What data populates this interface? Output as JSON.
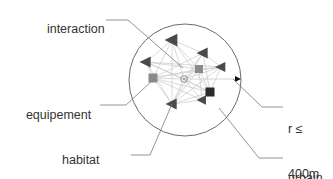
{
  "diagram": {
    "title": "urbain system",
    "labels": {
      "interaction": "interaction",
      "equipement": "equipement",
      "habitat_line1": "habitat",
      "habitat_line2": "groupe",
      "radius_line1": "r ≤",
      "radius_line2": "400m",
      "urbain_line1": "urbain",
      "urbain_line2": "system"
    },
    "colors": {
      "boundary_circle": "#6b6b6b",
      "leader_line": "#7a7a7a",
      "interaction_edge": "#c9c9c9",
      "node_triangle": "#4a4a4a",
      "node_square_grey": "#8a8a8a",
      "node_square_dark": "#2b2b2b",
      "hub": "#9a9a9a",
      "radius_arrow": "#111111",
      "text": "#333333",
      "background": "#ffffff"
    },
    "circle": {
      "cx": 185,
      "cy": 80,
      "r": 56,
      "stroke_width": 1
    },
    "radius_arrow": {
      "from_x": 185,
      "from_y": 79,
      "to_x": 241,
      "to_y": 79
    },
    "hub": {
      "x": 184,
      "y": 79,
      "r": 3.2
    },
    "nodes": [
      {
        "id": "n1",
        "kind": "triangle",
        "x": 172,
        "y": 40,
        "size": 7.5
      },
      {
        "id": "n2",
        "kind": "triangle",
        "x": 203,
        "y": 53,
        "size": 6.5
      },
      {
        "id": "n3",
        "kind": "triangle",
        "x": 146,
        "y": 62,
        "size": 6.5
      },
      {
        "id": "n4",
        "kind": "triangle",
        "x": 221,
        "y": 67,
        "size": 6.0
      },
      {
        "id": "n5",
        "kind": "triangle",
        "x": 172,
        "y": 104,
        "size": 6.5
      },
      {
        "id": "n6",
        "kind": "triangle",
        "x": 202,
        "y": 100,
        "size": 5.5
      },
      {
        "id": "n7",
        "kind": "square-grey",
        "x": 153,
        "y": 78,
        "size": 9
      },
      {
        "id": "n8",
        "kind": "square-grey",
        "x": 199,
        "y": 69,
        "size": 8
      },
      {
        "id": "n9",
        "kind": "square-dark",
        "x": 210,
        "y": 92,
        "size": 9
      }
    ],
    "edges": [
      [
        "n1",
        "n3"
      ],
      [
        "n1",
        "n7"
      ],
      [
        "n1",
        "n5"
      ],
      [
        "n1",
        "hub"
      ],
      [
        "n1",
        "n8"
      ],
      [
        "n1",
        "n9"
      ],
      [
        "n1",
        "n2"
      ],
      [
        "n2",
        "n7"
      ],
      [
        "n2",
        "hub"
      ],
      [
        "n2",
        "n9"
      ],
      [
        "n2",
        "n5"
      ],
      [
        "n2",
        "n4"
      ],
      [
        "n3",
        "n7"
      ],
      [
        "n3",
        "hub"
      ],
      [
        "n3",
        "n8"
      ],
      [
        "n3",
        "n9"
      ],
      [
        "n3",
        "n5"
      ],
      [
        "n3",
        "n4"
      ],
      [
        "n4",
        "n7"
      ],
      [
        "n4",
        "hub"
      ],
      [
        "n4",
        "n9"
      ],
      [
        "n4",
        "n5"
      ],
      [
        "n4",
        "n8"
      ],
      [
        "n5",
        "n7"
      ],
      [
        "n5",
        "hub"
      ],
      [
        "n5",
        "n8"
      ],
      [
        "n5",
        "n9"
      ],
      [
        "n5",
        "n6"
      ],
      [
        "n6",
        "n7"
      ],
      [
        "n6",
        "hub"
      ],
      [
        "n6",
        "n8"
      ],
      [
        "n6",
        "n9"
      ],
      [
        "n7",
        "hub"
      ],
      [
        "n7",
        "n8"
      ],
      [
        "n7",
        "n9"
      ],
      [
        "n8",
        "hub"
      ],
      [
        "n8",
        "n9"
      ],
      [
        "n9",
        "hub"
      ]
    ],
    "leaders": [
      {
        "name": "interaction",
        "points": "106,20 128,20 183,68"
      },
      {
        "name": "equipement",
        "points": "100,105 126,105 154,79"
      },
      {
        "name": "habitat",
        "points": "131,155 150,155 172,104"
      },
      {
        "name": "radius",
        "points": "283,107 262,107 233,79"
      },
      {
        "name": "urbain",
        "points": "283,158 259,158 219,108"
      }
    ]
  }
}
